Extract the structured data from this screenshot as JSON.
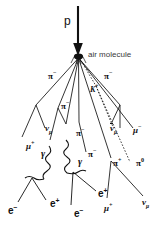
{
  "figure": {
    "name": "cosmic-ray-air-shower",
    "background_color": "#ffffff",
    "line_color": "#111111",
    "width": 161,
    "height": 235
  },
  "primary": {
    "particle": "p",
    "arrow": "down-arrow"
  },
  "interaction": {
    "label": "air molecule",
    "vertex": "primary-interaction-vertex"
  },
  "labels": {
    "pi_minus_left_upper": {
      "base": "π",
      "charge": "−"
    },
    "pi_minus_left_mid": {
      "base": "π",
      "charge": "−"
    },
    "pi_minus_center": {
      "base": "π",
      "charge": "−"
    },
    "pi_minus_center_low": {
      "base": "π",
      "charge": "−"
    },
    "pi_minus_right_upper": {
      "base": "π",
      "charge": "−"
    },
    "pi_minus_right_mid": {
      "base": "π",
      "charge": "−"
    },
    "pi_plus_low": {
      "base": "π",
      "charge": "+"
    },
    "pi_zero_right": {
      "base": "π",
      "charge": "0"
    },
    "k_plus": {
      "base": "K",
      "charge": "+"
    },
    "mu_plus_left": {
      "base": "μ",
      "charge": "+"
    },
    "mu_minus_right": {
      "base": "μ",
      "charge": "−"
    },
    "mu_plus_bottom": {
      "base": "μ",
      "charge": "+"
    },
    "nu_mu_left": {
      "base": "ν",
      "flavor": "μ",
      "bar": false
    },
    "nu_mu_bar_right": {
      "base": "ν",
      "flavor": "μ",
      "bar": true
    },
    "nu_mu_bottom": {
      "base": "ν",
      "flavor": "μ",
      "bar": false
    },
    "gamma_left": {
      "base": "γ"
    },
    "gamma_right": {
      "base": "γ"
    },
    "e_minus_1": {
      "base": "e",
      "charge": "−"
    },
    "e_plus_1": {
      "base": "e",
      "charge": "+"
    },
    "e_minus_2": {
      "base": "e",
      "charge": "−"
    },
    "e_plus_2": {
      "base": "e",
      "charge": "+"
    }
  },
  "legend_text": {
    "proton": "p",
    "air_molecule": "air molecule"
  }
}
